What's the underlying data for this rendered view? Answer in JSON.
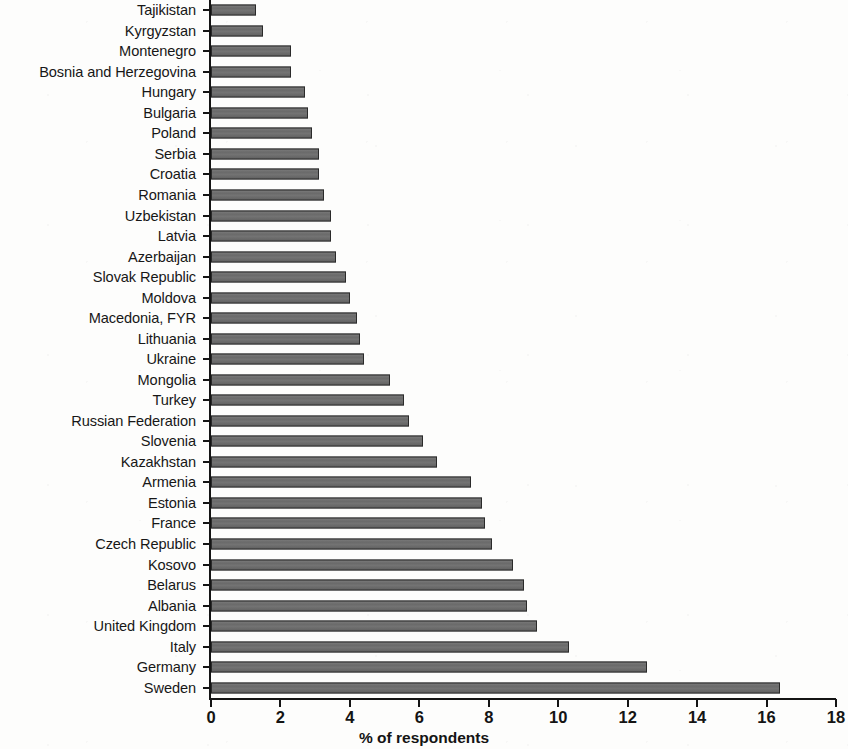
{
  "chart_data": {
    "type": "bar",
    "orientation": "horizontal",
    "title": "",
    "xlabel": "% of respondents",
    "ylabel": "",
    "xlim": [
      0,
      18
    ],
    "xticks": [
      0,
      2,
      4,
      6,
      8,
      10,
      12,
      14,
      16,
      18
    ],
    "grid": false,
    "legend": null,
    "bar_color": "#6d6d6d",
    "bar_edge_color": "#2a2a2a",
    "axis_color": "#141414",
    "background_color": "#fdfdfc",
    "categories": [
      "Tajikistan",
      "Kyrgyzstan",
      "Montenegro",
      "Bosnia and Herzegovina",
      "Hungary",
      "Bulgaria",
      "Poland",
      "Serbia",
      "Croatia",
      "Romania",
      "Uzbekistan",
      "Latvia",
      "Azerbaijan",
      "Slovak Republic",
      "Moldova",
      "Macedonia, FYR",
      "Lithuania",
      "Ukraine",
      "Mongolia",
      "Turkey",
      "Russian Federation",
      "Slovenia",
      "Kazakhstan",
      "Armenia",
      "Estonia",
      "France",
      "Czech Republic",
      "Kosovo",
      "Belarus",
      "Albania",
      "United Kingdom",
      "Italy",
      "Germany",
      "Sweden"
    ],
    "values": [
      1.3,
      1.5,
      2.3,
      2.3,
      2.7,
      2.8,
      2.9,
      3.1,
      3.1,
      3.25,
      3.45,
      3.45,
      3.6,
      3.9,
      4.0,
      4.2,
      4.3,
      4.4,
      5.15,
      5.55,
      5.7,
      6.1,
      6.5,
      7.5,
      7.8,
      7.9,
      8.1,
      8.7,
      9.0,
      9.1,
      9.4,
      10.3,
      12.55,
      16.4
    ]
  }
}
